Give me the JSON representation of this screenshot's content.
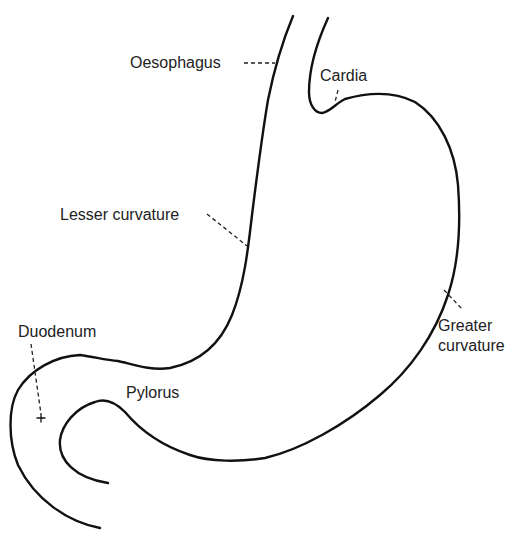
{
  "diagram": {
    "labels": {
      "oesophagus": "Oesophagus",
      "cardia": "Cardia",
      "lesser_curvature": "Lesser curvature",
      "greater_curvature_line1": "Greater",
      "greater_curvature_line2": "curvature",
      "duodenum": "Duodenum",
      "pylorus": "Pylorus"
    },
    "colors": {
      "stroke": "#111111",
      "text": "#222222",
      "background": "#ffffff"
    }
  }
}
